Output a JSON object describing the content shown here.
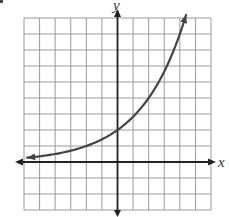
{
  "chart_data": {
    "type": "line",
    "title": "",
    "xlabel": "x",
    "ylabel": "y",
    "xlim": [
      -6,
      6
    ],
    "ylim": [
      -3,
      9
    ],
    "grid": true,
    "grid_step": 1,
    "function": "y = 2·(√2)^x",
    "series": [
      {
        "name": "exponential curve",
        "x": [
          -5.8,
          -4,
          -2,
          0,
          2,
          4,
          4.4
        ],
        "y": [
          0.27,
          0.5,
          1,
          2,
          4,
          8,
          9.2
        ]
      }
    ],
    "y_intercept": 2,
    "horizontal_asymptote": 0,
    "arrows": {
      "curve_both_ends": true,
      "axes_both_ends": true
    }
  },
  "labels": {
    "x_axis": "x",
    "y_axis": "y"
  },
  "colors": {
    "grid": "#9a9a9a",
    "axis": "#222222",
    "curve": "#444444"
  }
}
